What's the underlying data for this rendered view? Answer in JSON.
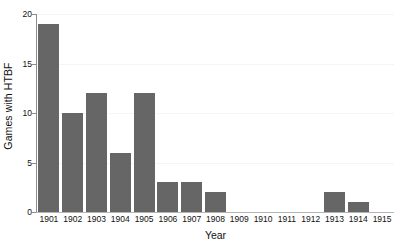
{
  "chart_data": {
    "type": "bar",
    "title": "",
    "subtitle": "",
    "xlabel": "Year",
    "ylabel": "Games with HTBF",
    "categories": [
      "1901",
      "1902",
      "1903",
      "1904",
      "1905",
      "1906",
      "1907",
      "1908",
      "1909",
      "1910",
      "1911",
      "1912",
      "1913",
      "1914",
      "1915"
    ],
    "values": [
      19,
      10,
      12,
      6,
      12,
      3,
      3,
      2,
      0,
      0,
      0,
      0,
      2,
      1,
      0
    ],
    "ylim": [
      0,
      20
    ],
    "yticks": [
      0,
      5,
      10,
      15,
      20
    ],
    "ytick_labels": [
      "0",
      "5",
      "10",
      "15",
      "20"
    ],
    "grid": true,
    "grid_axis": "y",
    "legend": null,
    "legend_position": "none",
    "bar_color": "#666666",
    "gridline_color": "#f5f5f5",
    "axis_color": "#8c8c8c",
    "background_color": "#ffffff",
    "text_color": "#111111"
  }
}
